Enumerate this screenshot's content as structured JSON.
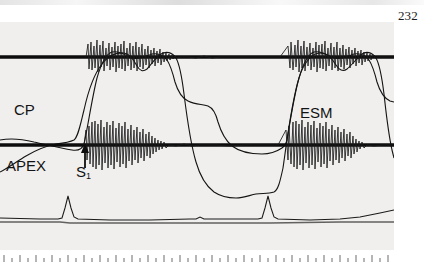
{
  "figure": {
    "kind": "phonocardiogram-apexcardiogram-tracing",
    "page_number": "232",
    "panel_background": "#f0efee",
    "trace_color": "#101010"
  },
  "labels": {
    "cp": "CP",
    "apex": "APEX",
    "esm": "ESM",
    "s1": "S",
    "s1_subscript": "1"
  },
  "chart_data": {
    "type": "line",
    "title": "",
    "xlabel": "",
    "ylabel": "",
    "grid": false,
    "legend": "none",
    "xlim": [
      0,
      394
    ],
    "ylim": [
      0,
      228
    ],
    "annotations": [
      {
        "text": "CP",
        "x": 14,
        "y": 101,
        "meaning": "carotid pulse tracing"
      },
      {
        "text": "APEX",
        "x": 6,
        "y": 157,
        "meaning": "apexcardiogram tracing"
      },
      {
        "text": "ESM",
        "x": 300,
        "y": 104,
        "meaning": "ejection systolic murmur"
      },
      {
        "text": "S1",
        "x": 76,
        "y": 163,
        "meaning": "first heart sound",
        "arrow_x": 85,
        "arrow_from_y": 168,
        "arrow_to_y": 146
      }
    ],
    "series": [
      {
        "name": "upper-phonocardiogram-baseline",
        "role": "phono-baseline",
        "baseline_y": 57,
        "points": [
          [
            0,
            57
          ],
          [
            394,
            57
          ]
        ]
      },
      {
        "name": "upper-phonocardiogram-murmur",
        "role": "murmur-burst",
        "baseline_y": 57,
        "bursts": [
          {
            "start_x": 88,
            "end_x": 170,
            "peak_amplitude": 22
          },
          {
            "start_x": 290,
            "end_x": 372,
            "peak_amplitude": 22
          }
        ]
      },
      {
        "name": "lower-phonocardiogram-baseline",
        "role": "phono-baseline",
        "baseline_y": 145,
        "points": [
          [
            0,
            145
          ],
          [
            394,
            145
          ]
        ]
      },
      {
        "name": "lower-phonocardiogram-murmur",
        "role": "murmur-burst",
        "baseline_y": 145,
        "bursts": [
          {
            "start_x": 86,
            "end_x": 150,
            "peak_amplitude": 24
          },
          {
            "start_x": 288,
            "end_x": 352,
            "peak_amplitude": 24
          }
        ]
      },
      {
        "name": "carotid-pulse",
        "role": "plateau-pulse",
        "cycles": [
          {
            "upstroke_x": 84,
            "peak_x": 110,
            "plateau_y": 42,
            "notch_x": 158,
            "downstroke_x": 168
          },
          {
            "upstroke_x": 286,
            "peak_x": 312,
            "plateau_y": 42,
            "notch_x": 360,
            "downstroke_x": 370
          }
        ]
      },
      {
        "name": "apexcardiogram",
        "role": "bifid-dome",
        "cycles": [
          {
            "foot_x": 72,
            "first_peak_x": 122,
            "dip_x": 140,
            "second_peak_x": 158,
            "peak_y": 38,
            "trough_y": 172
          },
          {
            "foot_x": 274,
            "first_peak_x": 324,
            "dip_x": 342,
            "second_peak_x": 360,
            "peak_y": 38,
            "trough_y": 172
          }
        ]
      },
      {
        "name": "electrocardiogram",
        "role": "ecg-lead",
        "baseline_y": 218,
        "r_waves": [
          {
            "x": 68,
            "peak_y": 196
          },
          {
            "x": 270,
            "peak_y": 196
          }
        ]
      }
    ],
    "timing_marks": {
      "count": 49,
      "spacing_px": 8,
      "y": 252,
      "long_tick_height": 7,
      "short_tick_height": 4
    }
  }
}
